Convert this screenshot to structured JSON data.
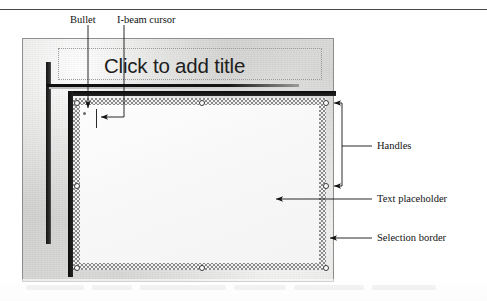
{
  "figure": {
    "type": "annotated-screenshot",
    "top_rule": true
  },
  "slide": {
    "title_placeholder_text": "Click to add title",
    "body_placeholder": {
      "bullet": "•",
      "caret": "I-beam"
    }
  },
  "annotations": {
    "top": [
      {
        "key": "bullet",
        "label": "Bullet"
      },
      {
        "key": "ibeam",
        "label": "I-beam cursor"
      }
    ],
    "right": [
      {
        "key": "handles",
        "label": "Handles"
      },
      {
        "key": "text_placeholder",
        "label": "Text placeholder"
      },
      {
        "key": "selection_border",
        "label": "Selection border"
      }
    ]
  },
  "handles": {
    "count": 8,
    "positions": [
      {
        "name": "top-left",
        "x": 77,
        "y": 103
      },
      {
        "name": "top-middle",
        "x": 202,
        "y": 103
      },
      {
        "name": "top-right",
        "x": 326,
        "y": 103
      },
      {
        "name": "middle-left",
        "x": 77,
        "y": 186
      },
      {
        "name": "middle-right",
        "x": 326,
        "y": 186
      },
      {
        "name": "bottom-left",
        "x": 77,
        "y": 268
      },
      {
        "name": "bottom-middle",
        "x": 202,
        "y": 268
      },
      {
        "name": "bottom-right",
        "x": 326,
        "y": 268
      }
    ]
  },
  "colors": {
    "ink": "#121212",
    "slide_background": "#d4d4d2",
    "placeholder_fill": "#fbfbfb",
    "selection_hatch": "#8a8a8a",
    "rule": "#4a4a4a"
  }
}
